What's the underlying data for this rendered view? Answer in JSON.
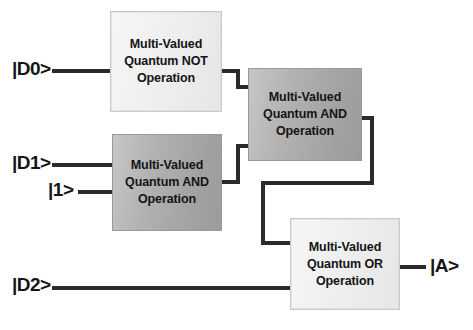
{
  "diagram": {
    "background_color": "#ffffff",
    "wire_color": "#2b2b2b",
    "text_color": "#141414",
    "gates": [
      {
        "id": "not",
        "name": "multi-valued-quantum-not-operation",
        "line1": "Multi-Valued",
        "line2": "Quantum NOT",
        "line3": "Operation",
        "fill": "#eeeeee",
        "style": "light"
      },
      {
        "id": "and2",
        "name": "multi-valued-quantum-and-operation-top",
        "line1": "Multi-Valued",
        "line2": "Quantum AND",
        "line3": "Operation",
        "fill": "#ababab",
        "style": "dark"
      },
      {
        "id": "and1",
        "name": "multi-valued-quantum-and-operation-left",
        "line1": "Multi-Valued",
        "line2": "Quantum AND",
        "line3": "Operation",
        "fill": "#ababab",
        "style": "dark"
      },
      {
        "id": "or",
        "name": "multi-valued-quantum-or-operation",
        "line1": "Multi-Valued",
        "line2": "Quantum OR",
        "line3": "Operation",
        "fill": "#eeeeee",
        "style": "light"
      }
    ],
    "ports": {
      "d0": "|D0>",
      "d1": "|D1>",
      "one": "|1>",
      "d2": "|D2>",
      "a": "|A>"
    },
    "connections": [
      {
        "from": "|D0>",
        "to": "multi-valued-quantum-not-operation"
      },
      {
        "from": "|D1>",
        "to": "multi-valued-quantum-and-operation-left"
      },
      {
        "from": "|1>",
        "to": "multi-valued-quantum-and-operation-left"
      },
      {
        "from": "multi-valued-quantum-not-operation",
        "to": "multi-valued-quantum-and-operation-top"
      },
      {
        "from": "multi-valued-quantum-and-operation-left",
        "to": "multi-valued-quantum-and-operation-top"
      },
      {
        "from": "multi-valued-quantum-and-operation-top",
        "to": "multi-valued-quantum-or-operation"
      },
      {
        "from": "|D2>",
        "to": "multi-valued-quantum-or-operation"
      },
      {
        "from": "multi-valued-quantum-or-operation",
        "to": "|A>"
      }
    ]
  }
}
